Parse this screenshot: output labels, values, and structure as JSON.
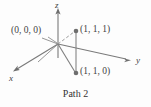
{
  "figure": {
    "caption": "Path 2",
    "line_color": "#7a7a7a",
    "dash_color": "#9a9a9a",
    "point_color": "#6e6e6e",
    "text_color": "#3f3f3f",
    "background": "#fdfdfd"
  },
  "axes": [
    {
      "name": "x",
      "label": "x",
      "direction": "down-left",
      "tip": {
        "x": 13,
        "y": 72
      }
    },
    {
      "name": "y",
      "label": "y",
      "direction": "right",
      "tip": {
        "x": 130,
        "y": 60
      }
    },
    {
      "name": "z",
      "label": "z",
      "direction": "up",
      "tip": {
        "x": 58,
        "y": 10
      }
    }
  ],
  "points": [
    {
      "name": "origin",
      "label": "(0, 0, 0)",
      "coords": [
        0,
        0,
        0
      ],
      "screen": {
        "x": 58,
        "y": 44
      },
      "marker": false
    },
    {
      "name": "corner-top",
      "label": "(1, 1, 1)",
      "coords": [
        1,
        1,
        1
      ],
      "screen": {
        "x": 76,
        "y": 31
      },
      "marker": true
    },
    {
      "name": "corner-bottom",
      "label": "(1, 1, 0)",
      "coords": [
        1,
        1,
        0
      ],
      "screen": {
        "x": 76,
        "y": 73
      },
      "marker": true
    }
  ],
  "segments": [
    {
      "name": "origin-to-111",
      "from": "origin",
      "to": "corner-top",
      "style": "dashed"
    },
    {
      "name": "111-to-110",
      "from": "corner-top",
      "to": "corner-bottom",
      "style": "solid"
    },
    {
      "name": "origin-to-110",
      "from": "origin",
      "to": "corner-bottom",
      "style": "solid"
    }
  ]
}
